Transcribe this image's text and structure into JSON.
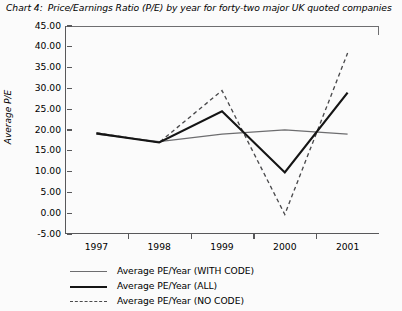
{
  "caption": {
    "label": "Chart 4:",
    "text": "Price/Earnings Ratio (P/E) by year for forty-two major UK quoted companies"
  },
  "axes": {
    "y_title": "Average P/E",
    "y_ticks": [
      "45.00",
      "40.00",
      "35.00",
      "30.00",
      "25.00",
      "20.00",
      "15.00",
      "10.00",
      "5.00",
      "0.00",
      "-5.00"
    ],
    "x_ticks": [
      "1997",
      "1998",
      "1999",
      "2000",
      "2001"
    ]
  },
  "legend": {
    "items": [
      {
        "label": "Average PE/Year (WITH CODE)",
        "style": "thin-solid",
        "color": "#6d6d6f"
      },
      {
        "label": "Average PE/Year (ALL)",
        "style": "thick-solid",
        "color": "#151515"
      },
      {
        "label": "Average PE/Year (NO CODE)",
        "style": "dashed",
        "color": "#4a4a4c"
      }
    ]
  },
  "chart_data": {
    "type": "line",
    "title": "Price/Earnings Ratio (P/E) by year for forty-two major UK quoted companies",
    "xlabel": "",
    "ylabel": "Average P/E",
    "categories": [
      "1997",
      "1998",
      "1999",
      "2000",
      "2001"
    ],
    "x": [
      1997,
      1998,
      1999,
      2000,
      2001
    ],
    "ylim": [
      -5,
      45
    ],
    "ytick_step": 5,
    "grid": false,
    "legend_position": "below-left",
    "series": [
      {
        "name": "Average PE/Year (WITH CODE)",
        "style": "thin-solid",
        "color": "#6d6d6f",
        "values": [
          19.0,
          17.2,
          19.0,
          20.0,
          19.0
        ]
      },
      {
        "name": "Average PE/Year (ALL)",
        "style": "thick-solid",
        "color": "#151515",
        "values": [
          19.2,
          17.0,
          24.5,
          9.8,
          29.0
        ]
      },
      {
        "name": "Average PE/Year (NO CODE)",
        "style": "dashed",
        "color": "#4a4a4c",
        "values": [
          19.3,
          17.0,
          29.5,
          -0.3,
          38.5
        ]
      }
    ]
  }
}
